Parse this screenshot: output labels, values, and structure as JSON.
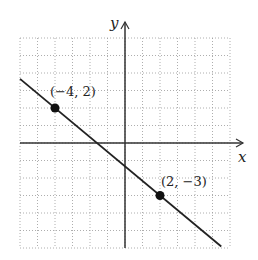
{
  "chart_data": {
    "type": "line",
    "title": "",
    "xlabel": "x",
    "ylabel": "y",
    "xlim": [
      -6,
      6
    ],
    "ylim": [
      -6,
      6
    ],
    "grid": true,
    "series": [
      {
        "name": "line",
        "x": [
          -6,
          6
        ],
        "y": [
          3.667,
          -6.333
        ]
      }
    ],
    "points": [
      {
        "x": -4,
        "y": 2,
        "label": "(−4, 2)"
      },
      {
        "x": 2,
        "y": -3,
        "label": "(2, −3)"
      }
    ],
    "line_equation": "y = -5/6 x - 4/3"
  },
  "labels": {
    "x_axis": "x",
    "y_axis": "y",
    "p1": "(−4, 2)",
    "p2": "(2, −3)"
  }
}
